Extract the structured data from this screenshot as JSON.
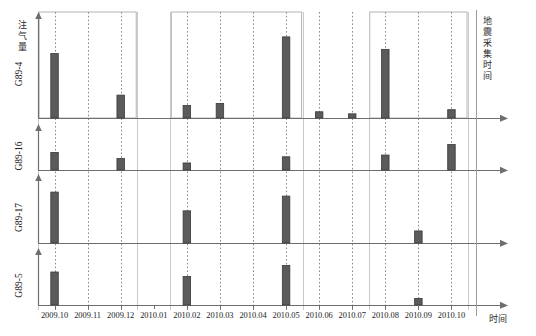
{
  "labels": {
    "y_axis_title": "注气量",
    "x_axis_title": "时间",
    "right_axis_title": "地震采集时间"
  },
  "chart_data": {
    "type": "bar",
    "title": "",
    "subtitle": "",
    "xlabel": "时间",
    "ylabel": "注气量",
    "annotations": [
      "地震采集时间"
    ],
    "grid": true,
    "grid_style": "dotted-vertical",
    "legend": "none",
    "categories": [
      "2009.10",
      "2009.11",
      "2009.12",
      "2010.01",
      "2010.02",
      "2010.03",
      "2010.04",
      "2010.05",
      "2010.06",
      "2010.07",
      "2010.08",
      "2010.09",
      "2010.10"
    ],
    "ylim": [
      0,
      100
    ],
    "panels": [
      {
        "name": "G89-4",
        "values": [
          62,
          0,
          22,
          0,
          12,
          14,
          0,
          78,
          6,
          4,
          66,
          0,
          8
        ]
      },
      {
        "name": "G89-16",
        "values": [
          40,
          0,
          26,
          0,
          16,
          0,
          0,
          30,
          0,
          0,
          34,
          0,
          58
        ]
      },
      {
        "name": "G89-17",
        "values": [
          76,
          0,
          0,
          0,
          48,
          0,
          0,
          70,
          0,
          0,
          0,
          18,
          0
        ]
      },
      {
        "name": "G89-5",
        "values": [
          60,
          0,
          0,
          0,
          52,
          0,
          0,
          72,
          0,
          0,
          0,
          12,
          0
        ]
      }
    ],
    "seismic_acquisition_times": [
      "2009.10",
      "2009.11",
      "2009.12",
      "2010.02",
      "2010.03",
      "2010.04",
      "2010.05",
      "2010.06",
      "2010.07",
      "2010.08",
      "2010.09",
      "2010.10"
    ],
    "highlight_boxes": [
      {
        "from": "2009.10",
        "to": "2009.12"
      },
      {
        "from": "2010.02",
        "to": "2010.05"
      },
      {
        "from": "2010.08",
        "to": "2010.10"
      }
    ]
  },
  "colors": {
    "bar_fill": "#5b5b5b",
    "bar_stroke": "#3a3a3a",
    "axis": "#6e6e6e",
    "grid_dotted": "#8a8a8a",
    "box_stroke": "#b4b4b4",
    "text": "#1d1d1d",
    "background": "#ffffff"
  }
}
